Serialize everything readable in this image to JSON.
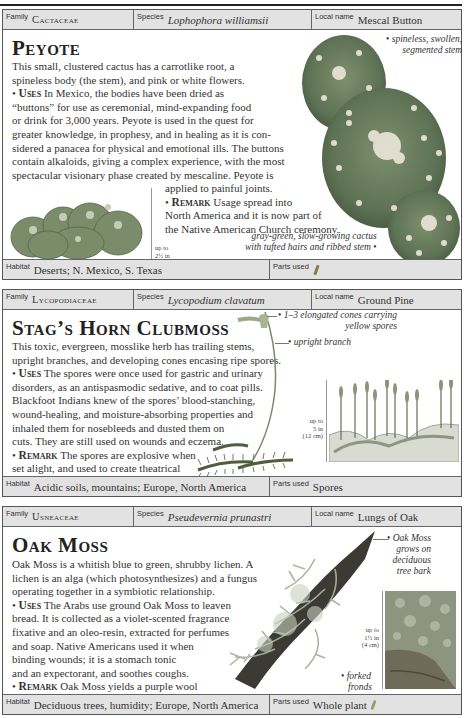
{
  "entries": [
    {
      "id": "peyote",
      "family_label": "Family",
      "family": "Cactaceae",
      "species_label": "Species",
      "species": "Lophophora williamsii",
      "local_name_label": "Local name",
      "local_name": "Mescal Button",
      "title": "Peyote",
      "description_lines": [
        "This small, clustered cactus has a carrotlike root, a",
        "spineless body (the stem), and pink or white flowers."
      ],
      "uses_label": "Uses",
      "uses_lines": [
        "In Mexico, the bodies have been dried as",
        "“buttons” for use as ceremonial, mind-expanding food",
        "or drink for 3,000 years. Peyote is used in the quest for",
        "greater knowledge, in prophesy, and in healing as it is con-",
        "sidered a panacea for physical and emotional ills. The buttons",
        "contain alkaloids, giving a complex experience, with the most",
        "spectacular visionary phase created by mescaline. Peyote is",
        "applied to painful joints."
      ],
      "remark_label": "Remark",
      "remark_lines": [
        "Usage spread into",
        "North America and it is now part of",
        "the Native American Church ceremony."
      ],
      "annotations": [
        "spineless, swollen,",
        "segmented stem",
        "gray-green, slow-growing cactus",
        "with tufted hairs and ribbed stem"
      ],
      "scale": [
        "up to",
        "2½ in",
        "(6 cm)"
      ],
      "habitat_label": "Habitat",
      "habitat": "Deserts; N. Mexico, S. Texas",
      "parts_used_label": "Parts used",
      "parts_used": "",
      "parts_used_icon": "root-icon"
    },
    {
      "id": "stags-horn-clubmoss",
      "family_label": "Family",
      "family": "Lycopodiaceae",
      "species_label": "Species",
      "species": "Lycopodium clavatum",
      "local_name_label": "Local name",
      "local_name": "Ground Pine",
      "title": "Stag’s Horn Clubmoss",
      "description_lines": [
        "This toxic, evergreen, mosslike herb has trailing stems,",
        "upright branches, and developing cones encasing ripe spores."
      ],
      "uses_label": "Uses",
      "uses_lines": [
        "The spores were once used for gastric and urinary",
        "disorders, as an antispasmodic sedative, and to coat pills.",
        "Blackfoot Indians knew of the spores’ blood-stanching,",
        "wound-healing, and moisture-absorbing properties and",
        "inhaled them for nosebleeds and dusted them on",
        "cuts. They are still used on wounds and eczema."
      ],
      "remark_label": "Remark",
      "remark_lines": [
        "The spores are explosive when",
        "set alight, and used to create theatrical",
        "lightning and added to fireworks."
      ],
      "annotations": [
        "1–3 elongated cones carrying",
        "yellow spores",
        "upright branch"
      ],
      "scale": [
        "up to",
        "5 in",
        "(12 cm)"
      ],
      "habitat_label": "Habitat",
      "habitat": "Acidic soils, mountains; Europe, North America",
      "parts_used_label": "Parts used",
      "parts_used": "Spores"
    },
    {
      "id": "oak-moss",
      "family_label": "Family",
      "family": "Usneaceae",
      "species_label": "Species",
      "species": "Pseudevernia prunastri",
      "local_name_label": "Local name",
      "local_name": "Lungs of Oak",
      "title": "Oak Moss",
      "description_lines": [
        "Oak Moss is a whitish blue to green, shrubby lichen. A",
        "lichen is an alga (which photosynthesizes) and a fungus",
        "operating together in a symbiotic relationship."
      ],
      "uses_label": "Uses",
      "uses_lines": [
        "The Arabs use ground Oak Moss to leaven",
        "bread. It is collected as a violet-scented fragrance",
        "fixative and an oleo-resin, extracted for perfumes",
        "and soap. Native Americans used it when",
        "binding wounds; it is a stomach tonic",
        "and an expectorant, and soothes coughs."
      ],
      "remark_label": "Remark",
      "remark_lines": [
        "Oak Moss yields a purple wool",
        "dye, but air pollution has made it scarce."
      ],
      "annotations": [
        "Oak Moss",
        "grows on",
        "deciduous",
        "tree bark",
        "forked",
        "fronds"
      ],
      "scale": [
        "up to",
        "1½ in",
        "(4 cm)"
      ],
      "habitat_label": "Habitat",
      "habitat": "Deciduous trees, humidity; Europe, North America",
      "parts_used_label": "Parts used",
      "parts_used": "Whole plant",
      "parts_used_icon": "leaf-icon"
    }
  ],
  "colors": {
    "header_bg": "#e2e2e2",
    "border": "#555555",
    "text": "#333333",
    "cactus_green": "#5f7a55",
    "moss_green": "#8a9a7a"
  }
}
